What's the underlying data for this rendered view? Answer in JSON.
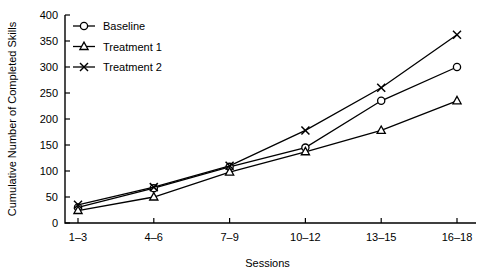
{
  "chart_data": {
    "type": "line",
    "title": "",
    "xlabel": "Sessions",
    "ylabel": "Cumulative Number of Completed Skills",
    "categories": [
      "1–3",
      "4–6",
      "7–9",
      "10–12",
      "13–15",
      "16–18"
    ],
    "ylim": [
      0,
      400
    ],
    "yticks": [
      0,
      50,
      100,
      150,
      200,
      250,
      300,
      350,
      400
    ],
    "ytick_labels": [
      "0",
      "50",
      "100",
      "150",
      "200",
      "250",
      "300",
      "350",
      "400"
    ],
    "grid": false,
    "legend_position": "upper-left-inside",
    "series": [
      {
        "name": "Baseline",
        "marker": "open-circle",
        "color": "#000000",
        "values": [
          30,
          67,
          108,
          145,
          235,
          300
        ]
      },
      {
        "name": "Treatment 1",
        "marker": "open-triangle",
        "color": "#000000",
        "values": [
          24,
          50,
          98,
          137,
          178,
          235
        ]
      },
      {
        "name": "Treatment 2",
        "marker": "cross",
        "color": "#000000",
        "values": [
          35,
          69,
          110,
          178,
          260,
          362
        ]
      }
    ]
  }
}
